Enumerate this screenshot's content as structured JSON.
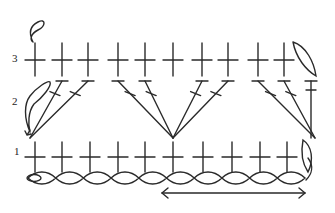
{
  "diagram": {
    "type": "crochet-chart",
    "row_labels": [
      "3",
      "2",
      "1"
    ],
    "stroke_color": "#2a2a2a",
    "row3_stitch_x": [
      35,
      62,
      88,
      118,
      145,
      173,
      202,
      228,
      258,
      284
    ],
    "row1_stitch_x": [
      35,
      62,
      90,
      118,
      145,
      173,
      203,
      232,
      260,
      287
    ],
    "row2_groups": [
      {
        "base_x": 30,
        "tops": [
          62,
          88
        ]
      },
      {
        "base_x": 173,
        "tops": [
          118,
          145,
          202,
          228
        ]
      },
      {
        "base_x": 315,
        "tops": [
          258,
          284
        ]
      }
    ],
    "chain_count": 10,
    "repeat_arrow": {
      "from_x": 162,
      "to_x": 305
    }
  }
}
